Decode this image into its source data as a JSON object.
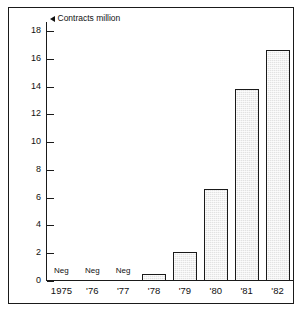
{
  "chart_data": {
    "type": "bar",
    "title": "Contracts million",
    "title_marker": "left-caret",
    "xlabel": "",
    "ylabel": "",
    "categories": [
      "1975",
      "'76",
      "'77",
      "'78",
      "'79",
      "'80",
      "'81",
      "'82"
    ],
    "values": [
      0,
      0,
      0,
      0.5,
      2.1,
      6.6,
      13.8,
      16.6
    ],
    "point_labels": [
      "Neg",
      "Neg",
      "Neg",
      "",
      "",
      "",
      "",
      ""
    ],
    "ylim": [
      0,
      18
    ],
    "ytick_values": [
      0,
      2,
      4,
      6,
      8,
      10,
      12,
      14,
      16,
      18
    ],
    "ytick_labels": [
      "0",
      "2",
      "4",
      "6",
      "8",
      "10",
      "12",
      "14",
      "16",
      "18"
    ],
    "grid": false,
    "legend": false,
    "bar_fill_color": "#e2e2e2",
    "bar_edge_color": "#1a1a1a",
    "axis_color": "#1a1a1a",
    "background_color": "#ffffff",
    "frame": true
  }
}
